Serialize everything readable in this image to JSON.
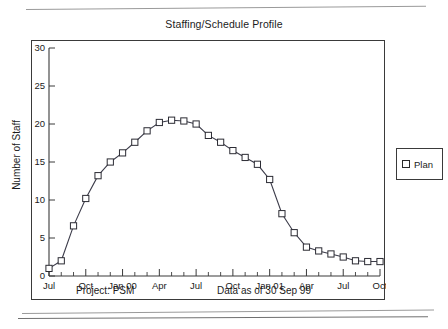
{
  "chart_data": {
    "type": "line",
    "title": "Staffing/Schedule Profile",
    "xlabel": "",
    "ylabel": "Number of Staff",
    "ylim": [
      0,
      30
    ],
    "yticks": [
      0,
      5,
      10,
      15,
      20,
      25,
      30
    ],
    "grid": false,
    "legend_position": "right",
    "x_tick_labels": [
      "Jul",
      "Oct",
      "Jan 00",
      "Apr",
      "Jul",
      "Oct",
      "Jan 01",
      "Apr",
      "Jul",
      "Oct"
    ],
    "x_tick_label_indices": [
      0,
      3,
      6,
      9,
      12,
      15,
      18,
      21,
      24,
      27
    ],
    "x": [
      "Jul 99",
      "Aug 99",
      "Sep 99",
      "Oct 99",
      "Nov 99",
      "Dec 99",
      "Jan 00",
      "Feb 00",
      "Mar 00",
      "Apr 00",
      "May 00",
      "Jun 00",
      "Jul 00",
      "Aug 00",
      "Sep 00",
      "Oct 00",
      "Nov 00",
      "Dec 00",
      "Jan 01",
      "Feb 01",
      "Mar 01",
      "Apr 01",
      "May 01",
      "Jun 01",
      "Jul 01",
      "Aug 01",
      "Sep 01",
      "Oct 01"
    ],
    "series": [
      {
        "name": "Plan",
        "marker": "open-square",
        "color": "#2b2b33",
        "values": [
          1.0,
          2.0,
          6.6,
          10.2,
          13.2,
          15.0,
          16.2,
          17.6,
          19.1,
          20.2,
          20.5,
          20.4,
          20.0,
          18.5,
          17.6,
          16.5,
          15.6,
          14.7,
          12.7,
          8.2,
          5.7,
          3.8,
          3.3,
          2.9,
          2.5,
          2.0,
          1.9,
          1.9
        ]
      }
    ],
    "annotations": {
      "project": "Project: PSM",
      "data_as_of": "Data as of 30 Sep 99"
    }
  },
  "legend": {
    "entries": [
      {
        "label": "Plan"
      }
    ]
  }
}
